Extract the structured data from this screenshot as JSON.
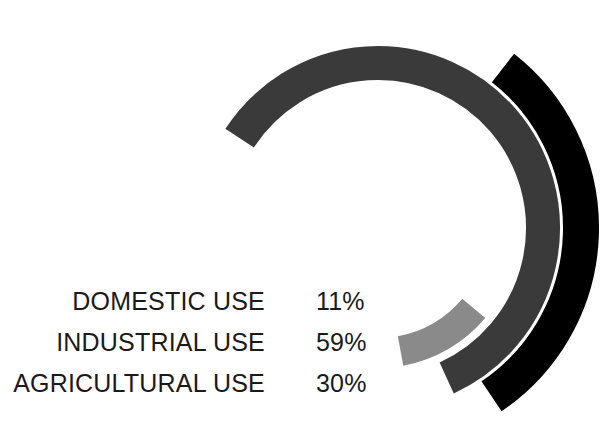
{
  "chart_data": {
    "type": "pie",
    "variant": "concentric-radial-bar",
    "title": "",
    "xlabel": "",
    "ylabel": "",
    "unit": "%",
    "legend_position": "left",
    "grid": false,
    "categories": [
      "DOMESTIC USE",
      "INDUSTRIAL USE",
      "AGRICULTURAL USE"
    ],
    "values": [
      11,
      59,
      30
    ],
    "value_labels": [
      "11%",
      "59%",
      "30%"
    ],
    "colors": [
      "#8a8a8a",
      "#3a3a3a",
      "#000000"
    ],
    "series": [
      {
        "name": "DOMESTIC USE",
        "value": 11,
        "label": "11%",
        "color": "#8a8a8a",
        "ring": "inner",
        "radius": 125,
        "thickness": 30,
        "start_angle_deg": 40,
        "sweep_deg": 39.6
      },
      {
        "name": "INDUSTRIAL USE",
        "value": 59,
        "label": "59%",
        "color": "#3a3a3a",
        "ring": "middle",
        "radius": 165,
        "thickness": 34,
        "start_angle_deg": -147,
        "sweep_deg": 212.4
      },
      {
        "name": "AGRICULTURAL USE",
        "value": 30,
        "label": "30%",
        "color": "#000000",
        "ring": "outer",
        "radius": 203,
        "thickness": 36,
        "start_angle_deg": -52,
        "sweep_deg": 108
      }
    ]
  },
  "legend": {
    "rows": [
      {
        "label": "DOMESTIC USE",
        "value": "11%",
        "color": "#8a8a8a"
      },
      {
        "label": "INDUSTRIAL USE",
        "value": "59%",
        "color": "#3a3a3a"
      },
      {
        "label": "AGRICULTURAL USE",
        "value": "30%",
        "color": "#000000"
      }
    ]
  },
  "colors": {
    "background": "#ffffff",
    "text": "#1a1a1a",
    "domestic": "#8a8a8a",
    "industrial": "#3a3a3a",
    "agricultural": "#000000"
  }
}
